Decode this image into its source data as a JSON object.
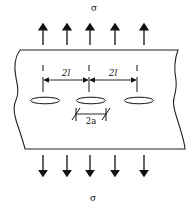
{
  "diagram": {
    "stress_top_label": "σ",
    "stress_bottom_label": "σ",
    "spacing_label_left": "2l",
    "spacing_label_right": "2l",
    "hole_width_label": "2a",
    "arrows_top_count": 5,
    "arrows_bottom_count": 5,
    "holes_count": 3,
    "colors": {
      "stroke": "#111111",
      "background": "#ffffff"
    }
  }
}
